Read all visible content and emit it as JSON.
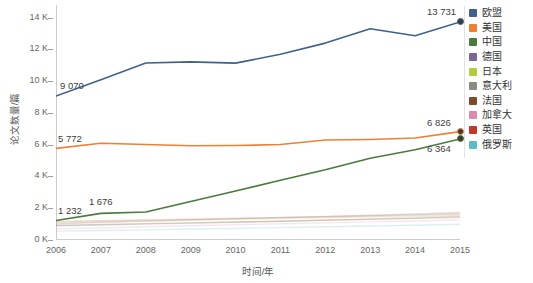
{
  "chart_data": {
    "type": "line",
    "title": "",
    "xlabel": "时间/年",
    "ylabel": "论文数量/篇",
    "x": [
      2006,
      2007,
      2008,
      2009,
      2010,
      2011,
      2012,
      2013,
      2014,
      2015
    ],
    "xtick_labels": [
      "2006",
      "2007",
      "2008",
      "2009",
      "2010",
      "2011",
      "2012",
      "2013",
      "2014",
      "2015"
    ],
    "ytick_labels": [
      "0 K",
      "2 K",
      "4 K",
      "6 K",
      "8 K",
      "10 K",
      "12 K",
      "14 K"
    ],
    "ytick_values": [
      0,
      2000,
      4000,
      6000,
      8000,
      10000,
      12000,
      14000
    ],
    "ylim": [
      0,
      14800
    ],
    "xlim": [
      2006,
      2015
    ],
    "grid": false,
    "legend_position": "right",
    "series": [
      {
        "name": "欧盟",
        "color": "#41618c",
        "values": [
          9070,
          10100,
          11150,
          11220,
          11140,
          11700,
          12400,
          13300,
          12860,
          13731
        ],
        "emphasis": true
      },
      {
        "name": "美国",
        "color": "#ef8033",
        "values": [
          5772,
          6090,
          6010,
          5940,
          5950,
          6010,
          6300,
          6330,
          6420,
          6826
        ],
        "emphasis": true
      },
      {
        "name": "中国",
        "color": "#4a7a3c",
        "values": [
          1232,
          1676,
          1760,
          2420,
          3090,
          3760,
          4420,
          5150,
          5680,
          6364
        ],
        "emphasis": true
      },
      {
        "name": "德国",
        "color": "#7b6593",
        "values": [
          1010,
          1120,
          1190,
          1270,
          1340,
          1420,
          1490,
          1560,
          1640,
          1730
        ],
        "emphasis": false
      },
      {
        "name": "日本",
        "color": "#b5c93f",
        "values": [
          1080,
          1130,
          1180,
          1240,
          1300,
          1350,
          1400,
          1440,
          1490,
          1560
        ],
        "emphasis": false
      },
      {
        "name": "意大利",
        "color": "#8b8b83",
        "values": [
          880,
          940,
          1000,
          1060,
          1120,
          1180,
          1250,
          1320,
          1400,
          1500
        ],
        "emphasis": false
      },
      {
        "name": "法国",
        "color": "#7d4a2a",
        "values": [
          920,
          980,
          1030,
          1080,
          1130,
          1180,
          1240,
          1300,
          1360,
          1430
        ],
        "emphasis": false
      },
      {
        "name": "加拿大",
        "color": "#d98bb0",
        "values": [
          700,
          760,
          830,
          900,
          960,
          1020,
          1080,
          1140,
          1200,
          1280
        ],
        "emphasis": false
      },
      {
        "name": "英国",
        "color": "#c0392b",
        "values": [
          1150,
          1210,
          1260,
          1310,
          1360,
          1410,
          1460,
          1510,
          1570,
          1640
        ],
        "emphasis": false
      },
      {
        "name": "俄罗斯",
        "color": "#5bbcc4",
        "values": [
          560,
          600,
          640,
          690,
          730,
          780,
          830,
          880,
          930,
          990
        ],
        "emphasis": false
      }
    ],
    "annotations": [
      {
        "text": "9 070",
        "series": "欧盟",
        "x": 2006,
        "y": 9070
      },
      {
        "text": "13 731",
        "series": "欧盟",
        "x": 2015,
        "y": 13731
      },
      {
        "text": "5 772",
        "series": "美国",
        "x": 2006,
        "y": 5772
      },
      {
        "text": "6 826",
        "series": "美国",
        "x": 2015,
        "y": 6826
      },
      {
        "text": "1 232",
        "series": "中国",
        "x": 2006,
        "y": 1232
      },
      {
        "text": "1 676",
        "series": "中国",
        "x": 2007,
        "y": 1676
      },
      {
        "text": "6 364",
        "series": "中国",
        "x": 2015,
        "y": 6364
      }
    ],
    "markers": [
      {
        "series": "欧盟",
        "x": 2015,
        "y": 13731,
        "color": "#41618c"
      },
      {
        "series": "美国",
        "x": 2015,
        "y": 6826,
        "color": "#ef8033"
      },
      {
        "series": "中国",
        "x": 2015,
        "y": 6364,
        "color": "#4a7a3c"
      }
    ]
  },
  "legend": {
    "items": [
      {
        "label": "欧盟",
        "color": "#41618c"
      },
      {
        "label": "美国",
        "color": "#ef8033"
      },
      {
        "label": "中国",
        "color": "#4a7a3c"
      },
      {
        "label": "德国",
        "color": "#7b6593"
      },
      {
        "label": "日本",
        "color": "#b5c93f"
      },
      {
        "label": "意大利",
        "color": "#8b8b83"
      },
      {
        "label": "法国",
        "color": "#7d4a2a"
      },
      {
        "label": "加拿大",
        "color": "#d98bb0"
      },
      {
        "label": "英国",
        "color": "#c0392b"
      },
      {
        "label": "俄罗斯",
        "color": "#5bbcc4"
      }
    ]
  }
}
